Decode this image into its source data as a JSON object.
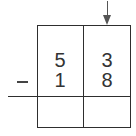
{
  "problem": {
    "operation": "subtraction",
    "operator_symbol": "−",
    "columns": [
      "tens",
      "ones"
    ],
    "minuend": {
      "tens": "5",
      "ones": "3"
    },
    "subtrahend": {
      "tens": "1",
      "ones": "8"
    },
    "answer": {
      "tens": "",
      "ones": ""
    }
  },
  "arrow": {
    "icon": "down-arrow-icon",
    "points_to_column": "ones"
  },
  "colors": {
    "ink": "#2e2e2e",
    "background": "#ffffff"
  }
}
